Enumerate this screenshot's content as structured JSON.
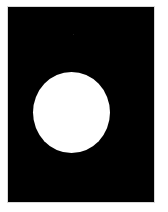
{
  "image": {
    "description": "White disc on black rectangular panel",
    "background_color": "#ffffff",
    "panel": {
      "color": "#000000",
      "x": 8,
      "y": 7,
      "width": 146,
      "height": 195
    },
    "disc": {
      "color": "#ffffff",
      "center_x": 71.5,
      "center_y": 112.5,
      "width": 77,
      "height": 81
    }
  }
}
